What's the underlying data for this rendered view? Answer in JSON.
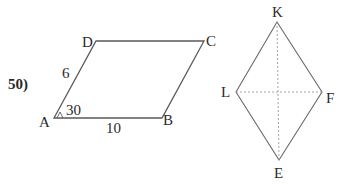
{
  "problem": {
    "number_label": "50)"
  },
  "parallelogram": {
    "vertices": {
      "A": "A",
      "B": "B",
      "C": "C",
      "D": "D"
    },
    "side_AD": "6",
    "side_AB": "10",
    "angle_A": "30"
  },
  "rhombus": {
    "vertices": {
      "K": "K",
      "L": "L",
      "F": "F",
      "E": "E"
    },
    "diagonals": [
      "KE",
      "LF"
    ]
  },
  "colors": {
    "stroke": "#5a5a5a",
    "dashed": "#9a9a9a",
    "text": "#2a2a2a"
  }
}
